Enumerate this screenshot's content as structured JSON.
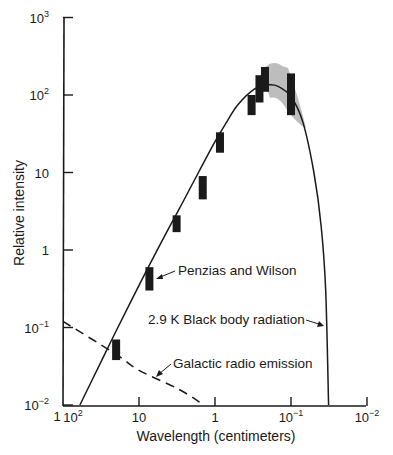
{
  "chart_data": {
    "type": "scatter",
    "title": "",
    "xlabel": "Wavelength (centimeters)",
    "ylabel": "Relative intensity",
    "x_scale": "log",
    "y_scale": "log",
    "x_reversed": true,
    "xlim": [
      100,
      0.01
    ],
    "ylim": [
      0.01,
      1000
    ],
    "grid": false,
    "x_ticks": [
      {
        "value": 100,
        "base": "10",
        "exp": "2"
      },
      {
        "value": 10,
        "base": "10",
        "exp": ""
      },
      {
        "value": 1,
        "base": "1",
        "exp": ""
      },
      {
        "value": 0.1,
        "base": "10",
        "exp": "−1"
      },
      {
        "value": 0.01,
        "base": "10",
        "exp": "−2"
      }
    ],
    "y_ticks": [
      {
        "value": 1000,
        "base": "10",
        "exp": "3"
      },
      {
        "value": 100,
        "base": "10",
        "exp": "2"
      },
      {
        "value": 10,
        "base": "10",
        "exp": ""
      },
      {
        "value": 1,
        "base": "1",
        "exp": ""
      },
      {
        "value": 0.1,
        "base": "10",
        "exp": "−1"
      },
      {
        "value": 0.01,
        "base": "10",
        "exp": "−2"
      }
    ],
    "axis_artifact_label": "1",
    "series": [
      {
        "name": "2.9 K Black body radiation",
        "style": "solid-line",
        "points": [
          [
            60,
            0.01
          ],
          [
            30,
            0.04
          ],
          [
            20,
            0.09
          ],
          [
            10,
            0.35
          ],
          [
            5,
            1.3
          ],
          [
            3,
            3.3
          ],
          [
            2,
            7
          ],
          [
            1,
            25
          ],
          [
            0.7,
            45
          ],
          [
            0.5,
            75
          ],
          [
            0.3,
            120
          ],
          [
            0.2,
            135
          ],
          [
            0.15,
            130
          ],
          [
            0.1,
            95
          ],
          [
            0.07,
            45
          ],
          [
            0.05,
            10
          ],
          [
            0.04,
            2
          ],
          [
            0.035,
            0.3
          ],
          [
            0.032,
            0.01
          ]
        ]
      },
      {
        "name": "Galactic radio emission",
        "style": "dashed-line",
        "points": [
          [
            100,
            0.12
          ],
          [
            20,
            0.045
          ],
          [
            10,
            0.028
          ],
          [
            3,
            0.016
          ],
          [
            1.4,
            0.01
          ]
        ]
      },
      {
        "name": "Measurements",
        "style": "error-bars",
        "points": [
          {
            "wavelength_cm": 20,
            "low": 0.038,
            "high": 0.07
          },
          {
            "wavelength_cm": 7.3,
            "low": 0.3,
            "high": 0.6
          },
          {
            "wavelength_cm": 3.2,
            "low": 1.7,
            "high": 2.8
          },
          {
            "wavelength_cm": 1.45,
            "low": 4.5,
            "high": 9
          },
          {
            "wavelength_cm": 0.86,
            "low": 18,
            "high": 33
          },
          {
            "wavelength_cm": 0.33,
            "low": 55,
            "high": 100
          },
          {
            "wavelength_cm": 0.26,
            "low": 80,
            "high": 180
          },
          {
            "wavelength_cm": 0.22,
            "low": 110,
            "high": 230
          },
          {
            "wavelength_cm": 0.1,
            "low": 55,
            "high": 190
          }
        ]
      },
      {
        "name": "Balloon/rocket band (shaded)",
        "style": "gray-region",
        "wavelength_range_cm": [
          0.2,
          0.07
        ],
        "intensity_range": [
          60,
          250
        ]
      }
    ],
    "annotations": [
      {
        "text": "Penzias and Wilson",
        "points_to": "measurement at 7.3 cm"
      },
      {
        "text": "2.9 K Black body radiation",
        "points_to": "black body curve"
      },
      {
        "text": "Galactic radio emission",
        "points_to": "dashed line"
      }
    ]
  },
  "labels": {
    "ylabel": "Relative intensity",
    "xlabel": "Wavelength (centimeters)",
    "penzias": "Penzias and Wilson",
    "blackbody": "2.9 K Black body radiation",
    "galactic": "Galactic radio emission",
    "artifact": "1"
  },
  "colors": {
    "ink": "#1a1a1a",
    "shade": "#bdbdbd",
    "background": "#ffffff"
  }
}
